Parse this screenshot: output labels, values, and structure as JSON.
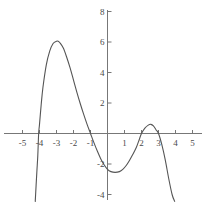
{
  "chart_data": {
    "type": "line",
    "title": "",
    "subtitle": "",
    "xlabel": "",
    "ylabel": "",
    "xlim": [
      -5,
      5
    ],
    "ylim": [
      -4.5,
      8
    ],
    "grid": false,
    "legend": null,
    "axis_style": "cartesian-cross",
    "line_color": "#555555",
    "axis_color": "#777777",
    "text_color": "#4a4a4a",
    "x_ticks": [
      -5,
      -4,
      -3,
      -2,
      -1,
      1,
      2,
      3,
      4,
      5
    ],
    "x_tick_labels": [
      "-5",
      "-4",
      "-3",
      "-2",
      "-1",
      "1",
      "2",
      "3",
      "4",
      "5"
    ],
    "y_ticks": [
      8,
      6,
      4,
      2,
      -2,
      -4
    ],
    "y_tick_labels": [
      "8",
      "6",
      "4",
      "2",
      "-2",
      "-4"
    ],
    "series": [
      {
        "name": "quartic",
        "description": "degree-4 polynomial, negative leading coefficient",
        "roots": [
          -4.05,
          -1.0,
          2.0,
          3.0
        ],
        "leading_coefficient": -0.1,
        "local_extrema": [
          {
            "x": -2.9,
            "y": 6.05,
            "kind": "local-maximum"
          },
          {
            "x": 0.45,
            "y": -2.55,
            "kind": "local-minimum"
          },
          {
            "x": 2.55,
            "y": 0.6,
            "kind": "local-maximum"
          }
        ],
        "x_domain_drawn": [
          -4.25,
          3.95
        ],
        "points": [
          {
            "x": -4.25,
            "y": -4.45
          },
          {
            "x": -4.2,
            "y": -3.4
          },
          {
            "x": -4.15,
            "y": -2.4
          },
          {
            "x": -4.1,
            "y": -1.45
          },
          {
            "x": -4.05,
            "y": 0.0
          },
          {
            "x": -4.0,
            "y": 0.6
          },
          {
            "x": -3.9,
            "y": 1.9
          },
          {
            "x": -3.8,
            "y": 3.0
          },
          {
            "x": -3.6,
            "y": 4.5
          },
          {
            "x": -3.4,
            "y": 5.4
          },
          {
            "x": -3.2,
            "y": 5.9
          },
          {
            "x": -3.0,
            "y": 6.05
          },
          {
            "x": -2.9,
            "y": 6.05
          },
          {
            "x": -2.8,
            "y": 5.95
          },
          {
            "x": -2.6,
            "y": 5.6
          },
          {
            "x": -2.4,
            "y": 5.0
          },
          {
            "x": -2.2,
            "y": 4.3
          },
          {
            "x": -2.0,
            "y": 3.5
          },
          {
            "x": -1.8,
            "y": 2.7
          },
          {
            "x": -1.6,
            "y": 1.95
          },
          {
            "x": -1.4,
            "y": 1.25
          },
          {
            "x": -1.2,
            "y": 0.6
          },
          {
            "x": -1.0,
            "y": 0.0
          },
          {
            "x": -0.8,
            "y": -0.6
          },
          {
            "x": -0.6,
            "y": -1.15
          },
          {
            "x": -0.4,
            "y": -1.65
          },
          {
            "x": -0.2,
            "y": -2.05
          },
          {
            "x": 0.0,
            "y": -2.35
          },
          {
            "x": 0.2,
            "y": -2.5
          },
          {
            "x": 0.45,
            "y": -2.55
          },
          {
            "x": 0.7,
            "y": -2.5
          },
          {
            "x": 0.9,
            "y": -2.35
          },
          {
            "x": 1.1,
            "y": -2.1
          },
          {
            "x": 1.3,
            "y": -1.75
          },
          {
            "x": 1.5,
            "y": -1.35
          },
          {
            "x": 1.7,
            "y": -0.9
          },
          {
            "x": 1.85,
            "y": -0.45
          },
          {
            "x": 2.0,
            "y": 0.0
          },
          {
            "x": 2.2,
            "y": 0.35
          },
          {
            "x": 2.4,
            "y": 0.55
          },
          {
            "x": 2.55,
            "y": 0.6
          },
          {
            "x": 2.7,
            "y": 0.5
          },
          {
            "x": 2.85,
            "y": 0.25
          },
          {
            "x": 3.0,
            "y": 0.0
          },
          {
            "x": 3.2,
            "y": -0.75
          },
          {
            "x": 3.4,
            "y": -1.75
          },
          {
            "x": 3.6,
            "y": -2.95
          },
          {
            "x": 3.8,
            "y": -4.0
          },
          {
            "x": 3.95,
            "y": -4.45
          }
        ]
      }
    ]
  }
}
